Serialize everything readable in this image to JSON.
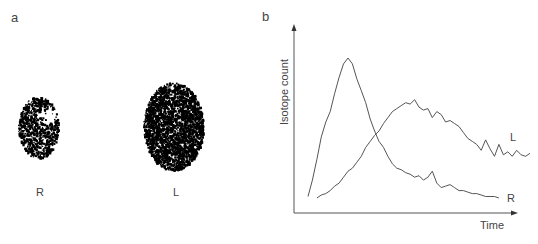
{
  "panel_a": {
    "label": "a",
    "kidneys": [
      {
        "label": "R",
        "description": "small scan, photon-deficient upper-medial region"
      },
      {
        "label": "L",
        "description": "large, dense uniform scan"
      }
    ]
  },
  "panel_b": {
    "label": "b"
  },
  "chart_data": {
    "type": "line",
    "title": "",
    "xlabel": "Time",
    "ylabel": "Isotope count",
    "x_ticks": [],
    "y_ticks": [],
    "grid": false,
    "xlim": [
      0,
      100
    ],
    "ylim": [
      0,
      100
    ],
    "series": [
      {
        "name": "R",
        "label": "R",
        "x": [
          0,
          2,
          4,
          6,
          8,
          10,
          12,
          14,
          16,
          18,
          20,
          22,
          24,
          26,
          28,
          30,
          32,
          34,
          36,
          38,
          40,
          42,
          44,
          46,
          48,
          50,
          52,
          54,
          56,
          58,
          60,
          62,
          64,
          66,
          68,
          70,
          72,
          74,
          76,
          78,
          80,
          82,
          84,
          86
        ],
        "values": [
          3,
          14,
          28,
          43,
          53,
          60,
          72,
          83,
          92,
          96,
          92,
          82,
          74,
          66,
          55,
          47,
          40,
          36,
          30,
          25,
          22,
          21,
          19,
          18,
          16,
          17,
          14,
          16,
          20,
          12,
          9,
          10,
          11,
          9,
          7,
          7,
          6,
          5,
          5,
          4,
          3,
          3,
          3,
          2
        ]
      },
      {
        "name": "L",
        "label": "L",
        "x": [
          4,
          6,
          8,
          10,
          12,
          14,
          16,
          18,
          20,
          22,
          24,
          26,
          28,
          30,
          32,
          34,
          36,
          38,
          40,
          42,
          44,
          46,
          48,
          50,
          52,
          54,
          56,
          58,
          60,
          62,
          64,
          66,
          68,
          70,
          72,
          74,
          76,
          78,
          80,
          82,
          84,
          86,
          88,
          90,
          92,
          94,
          96,
          98,
          100
        ],
        "values": [
          2,
          4,
          5,
          7,
          10,
          12,
          16,
          20,
          22,
          26,
          30,
          36,
          40,
          44,
          47,
          52,
          56,
          60,
          62,
          64,
          66,
          65,
          68,
          63,
          61,
          62,
          56,
          60,
          58,
          53,
          54,
          52,
          50,
          46,
          42,
          40,
          38,
          34,
          41,
          35,
          30,
          38,
          31,
          33,
          30,
          34,
          31,
          30,
          32
        ]
      }
    ],
    "annotations": [
      "R",
      "L"
    ]
  }
}
